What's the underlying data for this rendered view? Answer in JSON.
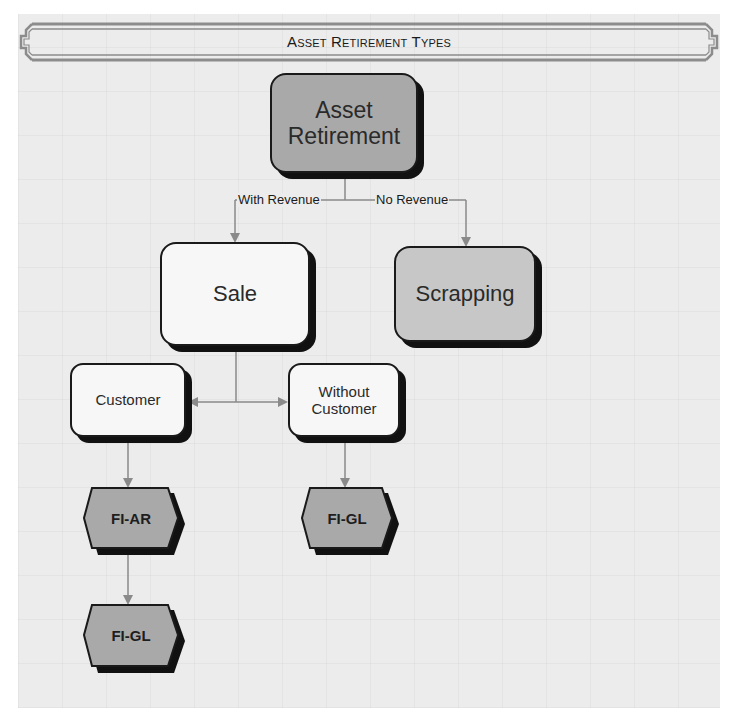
{
  "title": "Asset Retirement Types",
  "colors": {
    "background": "#ececec",
    "node_dark": "#a9a9a9",
    "node_mid": "#c7c7c7",
    "node_light": "#f7f7f7",
    "border": "#1a1a1a",
    "shadow": "#111111",
    "connector": "#8a8a8a"
  },
  "nodes": {
    "asset_retirement": {
      "label_line1": "Asset",
      "label_line2": "Retirement",
      "shape": "rounded-rect"
    },
    "sale": {
      "label": "Sale",
      "shape": "rounded-rect"
    },
    "scrapping": {
      "label": "Scrapping",
      "shape": "rounded-rect"
    },
    "customer": {
      "label": "Customer",
      "shape": "rounded-rect"
    },
    "without_customer": {
      "label_line1": "Without",
      "label_line2": "Customer",
      "shape": "rounded-rect"
    },
    "fi_ar": {
      "label": "FI-AR",
      "shape": "hexagon"
    },
    "fi_gl_right": {
      "label": "FI-GL",
      "shape": "hexagon"
    },
    "fi_gl_bottom": {
      "label": "FI-GL",
      "shape": "hexagon"
    }
  },
  "edges": [
    {
      "from": "Asset Retirement",
      "to": "Sale",
      "label": "With Revenue"
    },
    {
      "from": "Asset Retirement",
      "to": "Scrapping",
      "label": "No Revenue"
    },
    {
      "from": "Sale",
      "to": "Customer",
      "label": ""
    },
    {
      "from": "Sale",
      "to": "Without Customer",
      "label": ""
    },
    {
      "from": "Customer",
      "to": "FI-AR",
      "label": ""
    },
    {
      "from": "Without Customer",
      "to": "FI-GL",
      "label": ""
    },
    {
      "from": "FI-AR",
      "to": "FI-GL",
      "label": ""
    }
  ],
  "edge_labels": {
    "with_revenue": "With Revenue",
    "no_revenue": "No Revenue"
  }
}
